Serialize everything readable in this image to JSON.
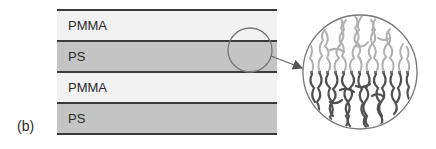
{
  "figure": {
    "panel_label": "(b)",
    "layers": [
      {
        "label": "PMMA",
        "fill": "#f2f2f2"
      },
      {
        "label": "PS",
        "fill": "#c4c4c4"
      },
      {
        "label": "PMMA",
        "fill": "#f2f2f2"
      },
      {
        "label": "PS",
        "fill": "#c4c4c4"
      }
    ],
    "magnifier": {
      "source_circle": {
        "cx": 250,
        "cy": 50,
        "r": 22
      },
      "zoom_circle": {
        "cx": 360,
        "cy": 72,
        "r": 57
      },
      "light_chain_color": "#b0b0b0",
      "dark_chain_color": "#505050"
    }
  }
}
